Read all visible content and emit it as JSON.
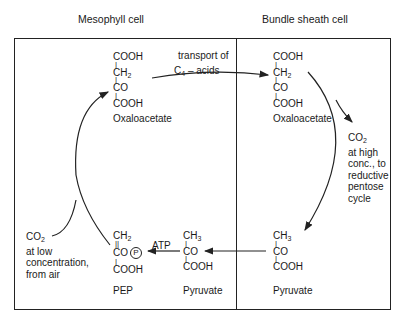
{
  "headers": {
    "mesophyll": "Mesophyll cell",
    "bundle_sheath": "Bundle sheath cell"
  },
  "molecules": {
    "oaa_meso": {
      "lines": [
        "COOH",
        "CH",
        "CO",
        "COOH"
      ],
      "ch_sub": "2",
      "name": "Oxaloacetate"
    },
    "oaa_bundle": {
      "lines": [
        "COOH",
        "CH",
        "CO",
        "COOH"
      ],
      "ch_sub": "2",
      "name": "Oxaloacetate"
    },
    "pyr_bundle": {
      "lines": [
        "CH",
        "CO",
        "COOH"
      ],
      "ch_sub": "3",
      "name": "Pyruvate"
    },
    "pyr_meso": {
      "lines": [
        "CH",
        "CO",
        "COOH"
      ],
      "ch_sub": "3",
      "name": "Pyruvate"
    },
    "pep": {
      "lines": [
        "CH",
        "CO",
        "COOH"
      ],
      "ch_sub": "2",
      "phosphate": "P",
      "name": "PEP"
    }
  },
  "labels": {
    "transport_line1": "transport of",
    "transport_c": "C",
    "transport_sub": "4",
    "transport_rest": " – acids",
    "atp": "ATP",
    "co2_high": {
      "co": "CO",
      "sub": "2",
      "lines": [
        "at high",
        "conc., to",
        "reductive",
        "pentose",
        "cycle"
      ]
    },
    "co2_low": {
      "co": "CO",
      "sub": "2",
      "lines": [
        "at low",
        "concentration,",
        "from air"
      ]
    }
  }
}
